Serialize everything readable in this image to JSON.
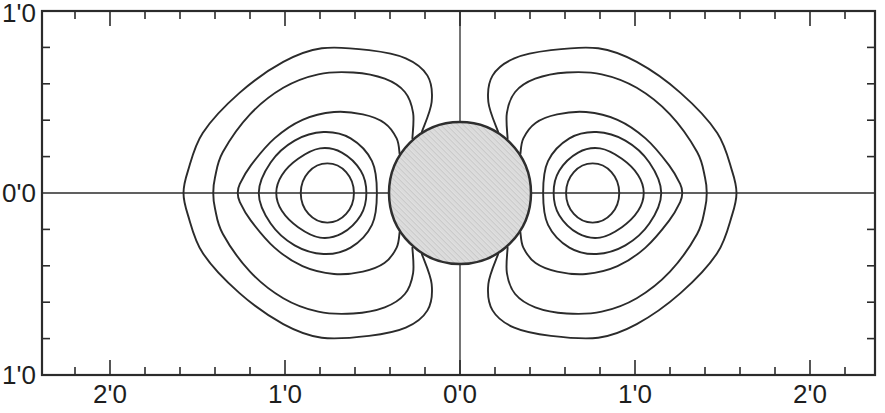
{
  "figure": {
    "background": "#ffffff",
    "line_color": "#2b2b2b",
    "text_color": "#1e1e1e"
  },
  "chart_data": {
    "type": "contour",
    "title": "",
    "xlabel": "",
    "ylabel": "",
    "grid": false,
    "x_axis": {
      "range": [
        -2.4,
        2.4
      ],
      "tick_step": 0.2,
      "major_ticks": [
        -2,
        -1,
        0,
        1,
        2
      ],
      "labels": [
        {
          "text": "2'0",
          "value": -2
        },
        {
          "text": "1'0",
          "value": -1
        },
        {
          "text": "0'0",
          "value": 0
        },
        {
          "text": "1'0",
          "value": 1
        },
        {
          "text": "2'0",
          "value": 2
        }
      ]
    },
    "y_axis": {
      "range": [
        -1.0,
        1.0
      ],
      "tick_step": 0.2,
      "major_ticks": [
        -1,
        0,
        1
      ],
      "labels": [
        {
          "text": "1'0",
          "value": 1
        },
        {
          "text": "0'0",
          "value": 0
        },
        {
          "text": "1'0",
          "value": -1
        }
      ]
    },
    "mapping": {
      "x0": 460,
      "y0": 193,
      "px_per_x": 175,
      "px_per_y": 182,
      "frame": {
        "left": 42,
        "right": 875,
        "top": 11,
        "bottom": 375
      }
    },
    "sphere": {
      "cx": 0,
      "cy": 0,
      "radius_px": 71,
      "fill_base": "#e1e1e1",
      "fill_dot": "#c9c9c9",
      "stroke": "#2e2e2e"
    },
    "contours": {
      "note": "Keypoints for right lobe, upper half, in data units; mirrored in y and x to build both symmetric lobes",
      "open_curves": [
        [
          [
            0.218,
            0.335
          ],
          [
            0.162,
            0.5
          ],
          [
            0.186,
            0.645
          ],
          [
            0.31,
            0.74
          ],
          [
            0.52,
            0.785
          ],
          [
            0.79,
            0.795
          ],
          [
            1.01,
            0.72
          ],
          [
            1.26,
            0.55
          ],
          [
            1.47,
            0.33
          ],
          [
            1.555,
            0.12
          ],
          [
            1.58,
            0.0
          ]
        ],
        [
          [
            0.272,
            0.3
          ],
          [
            0.268,
            0.44
          ],
          [
            0.315,
            0.555
          ],
          [
            0.43,
            0.628
          ],
          [
            0.61,
            0.662
          ],
          [
            0.81,
            0.652
          ],
          [
            1.01,
            0.578
          ],
          [
            1.2,
            0.432
          ],
          [
            1.355,
            0.225
          ],
          [
            1.4,
            0.085
          ],
          [
            1.41,
            0.0
          ]
        ],
        [
          [
            0.345,
            0.215
          ],
          [
            0.362,
            0.3
          ],
          [
            0.432,
            0.385
          ],
          [
            0.555,
            0.432
          ],
          [
            0.72,
            0.445
          ],
          [
            0.9,
            0.402
          ],
          [
            1.06,
            0.3
          ],
          [
            1.195,
            0.152
          ],
          [
            1.258,
            0.05
          ],
          [
            1.27,
            0.0
          ]
        ]
      ],
      "closed_curves": [
        [
          [
            0.475,
            0.0
          ],
          [
            0.503,
            0.175
          ],
          [
            0.625,
            0.3
          ],
          [
            0.78,
            0.335
          ],
          [
            0.945,
            0.288
          ],
          [
            1.082,
            0.168
          ],
          [
            1.15,
            0.0
          ]
        ],
        [
          [
            0.535,
            0.0
          ],
          [
            0.567,
            0.122
          ],
          [
            0.675,
            0.222
          ],
          [
            0.8,
            0.245
          ],
          [
            0.925,
            0.188
          ],
          [
            1.018,
            0.098
          ],
          [
            1.05,
            0.0
          ]
        ]
      ],
      "inner_ellipse": {
        "cx": 0.758,
        "cy": 0.0,
        "rx": 0.152,
        "ry": 0.163
      },
      "stroke": "#2b2b2b",
      "stroke_width": 1.9
    }
  }
}
